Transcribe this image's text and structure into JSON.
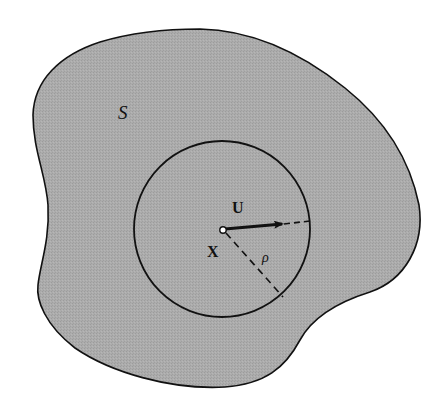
{
  "figure": {
    "region_label": "S",
    "vector_label": "U",
    "point_label": "X",
    "radius_label": "ρ"
  },
  "colors": {
    "background": "#ffffff",
    "region_fill": "#a9a9a9",
    "stroke": "#111111"
  },
  "geometry": {
    "circle": {
      "cx": 222,
      "cy": 229,
      "r": 88
    },
    "center_point": {
      "x": 223,
      "y": 230
    },
    "vector_arrow": {
      "x1": 225,
      "y1": 229,
      "x2": 282,
      "y2": 224
    },
    "vector_dashed_extension": {
      "x1": 282,
      "y1": 224,
      "x2": 310,
      "y2": 221
    },
    "radius_dashed_line": {
      "x1": 226,
      "y1": 233,
      "x2": 283,
      "y2": 297
    }
  }
}
